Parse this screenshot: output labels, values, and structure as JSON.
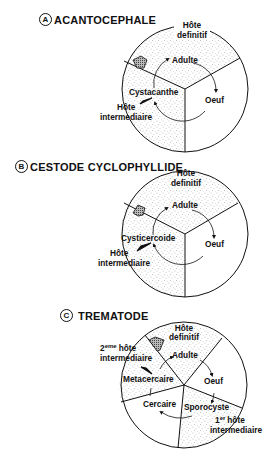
{
  "colors": {
    "ink": "#111111",
    "stipple": "#8a8a8a",
    "background": "#ffffff"
  },
  "diagrams": [
    {
      "badge": "A",
      "title": "ACANTOCEPHALE",
      "labels": {
        "host_def_1": "Hôte",
        "host_def_2": "definitif",
        "adult": "Adulte",
        "egg": "Oeuf",
        "larva": "Cystacanthe",
        "host_int_1": "Hôte",
        "host_int_2": "intermediaire"
      }
    },
    {
      "badge": "B",
      "title": "CESTODE CYCLOPHYLLIDE",
      "labels": {
        "host_def_1": "Hôte",
        "host_def_2": "definitif",
        "adult": "Adulte",
        "egg": "Oeuf",
        "larva": "Cysticercoide",
        "host_int_1": "Hôte",
        "host_int_2": "intermediaire"
      }
    },
    {
      "badge": "C",
      "title": "TREMATODE",
      "labels": {
        "host_def_1": "Hôte",
        "host_def_2": "definitif",
        "second_host_1_a": "2",
        "second_host_1_sup": "eme",
        "second_host_1_b": "hôte",
        "second_host_2": "intermediaire",
        "adult": "Adulte",
        "egg": "Oeuf",
        "metacercaria": "Metacercaire",
        "cercaria": "Cercaire",
        "sporocyst": "Sporocyste",
        "first_host_1_a": "1",
        "first_host_1_sup": "er",
        "first_host_1_b": "hôte",
        "first_host_2": "intermediaire"
      }
    }
  ]
}
